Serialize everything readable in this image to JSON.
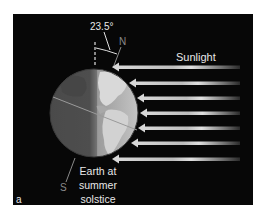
{
  "diagram": {
    "title": "Earth at summer solstice",
    "panel_label": "a",
    "labels": {
      "tilt_angle": "23.5°",
      "north_pole": "N",
      "south_pole": "S",
      "sunlight": "Sunlight",
      "caption": "Earth at summer solstice"
    },
    "elements": {
      "earth": {
        "shape": "circle",
        "center": [
          94,
          113
        ],
        "radius": 44,
        "night_side": "left",
        "day_side": "right",
        "terminator_x": 97
      },
      "axis_tilt_degrees": 23.5,
      "sunlight_arrows": {
        "count": 7,
        "direction": "right-to-left",
        "y_positions": [
          67,
          83,
          98,
          113,
          128,
          143,
          159
        ],
        "tip_x": [
          113,
          130,
          138,
          141,
          139,
          132,
          113
        ]
      }
    },
    "colors": {
      "background": "#070707",
      "page": "#ffffff",
      "text": "#e8e8e8",
      "pole_label": "#8a8a8a",
      "night": "#5a5a5a",
      "day": "#b8b8b8",
      "land_day": "#dcdcdc",
      "arrow": "#cfcfcf"
    }
  }
}
